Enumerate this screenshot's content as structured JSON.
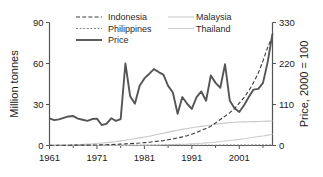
{
  "chart_data": {
    "type": "line",
    "title": "",
    "xlabel": "",
    "ylabel": "Million tonnes",
    "y2label": "Price, 2000 = 100",
    "xlim": [
      1961,
      2008
    ],
    "ylim": [
      0,
      90
    ],
    "y2lim": [
      0,
      330
    ],
    "grid": false,
    "legend_position": "top-inside",
    "xticks": [
      1961,
      1971,
      1981,
      1991,
      2001
    ],
    "xtick_labels": [
      "1961",
      "1971",
      "1981",
      "1991",
      "2001"
    ],
    "xminor_ticks": [
      1966,
      1976,
      1986,
      1996,
      2006
    ],
    "yticks": [
      0,
      30,
      60,
      90
    ],
    "ytick_labels": [
      "0",
      "30",
      "60",
      "90"
    ],
    "y2ticks": [
      0,
      110,
      220,
      330
    ],
    "y2tick_labels": [
      "0",
      "110",
      "220",
      "330"
    ],
    "x": [
      1961,
      1962,
      1963,
      1964,
      1965,
      1966,
      1967,
      1968,
      1969,
      1970,
      1971,
      1972,
      1973,
      1974,
      1975,
      1976,
      1977,
      1978,
      1979,
      1980,
      1981,
      1982,
      1983,
      1984,
      1985,
      1986,
      1987,
      1988,
      1989,
      1990,
      1991,
      1992,
      1993,
      1994,
      1995,
      1996,
      1997,
      1998,
      1999,
      2000,
      2001,
      2002,
      2003,
      2004,
      2005,
      2006,
      2007,
      2008
    ],
    "series": [
      {
        "name": "Indonesia",
        "axis": "left",
        "style": "dashed",
        "color": "#3a3a3a",
        "values": [
          0.2,
          0.2,
          0.2,
          0.2,
          0.2,
          0.3,
          0.3,
          0.3,
          0.3,
          0.4,
          0.4,
          0.5,
          0.6,
          0.7,
          0.8,
          1.0,
          1.2,
          1.4,
          1.6,
          1.8,
          2.1,
          2.4,
          2.8,
          3.2,
          3.6,
          4.2,
          4.8,
          5.5,
          6.3,
          7.2,
          8.3,
          9.6,
          11.0,
          12.5,
          14.0,
          16.5,
          19.0,
          21.5,
          24.0,
          27.0,
          31.0,
          35.0,
          40.0,
          46.0,
          53.0,
          62.0,
          72.0,
          80.0
        ]
      },
      {
        "name": "Philippines",
        "axis": "left",
        "style": "fine-dashed",
        "color": "#8a8a8a",
        "values": [
          0.1,
          0.1,
          0.1,
          0.1,
          0.1,
          0.1,
          0.1,
          0.1,
          0.1,
          0.1,
          0.1,
          0.1,
          0.1,
          0.2,
          0.2,
          0.2,
          0.2,
          0.2,
          0.2,
          0.2,
          0.2,
          0.2,
          0.3,
          0.3,
          0.3,
          0.3,
          0.3,
          0.3,
          0.3,
          0.3,
          0.3,
          0.3,
          0.3,
          0.3,
          0.3,
          0.3,
          0.4,
          0.4,
          0.4,
          0.4,
          0.4,
          0.4,
          0.4,
          0.5,
          0.5,
          0.5,
          0.5,
          0.5
        ]
      },
      {
        "name": "Malaysia",
        "axis": "left",
        "style": "light-solid",
        "color": "#c8c8c8",
        "values": [
          0.2,
          0.2,
          0.3,
          0.3,
          0.4,
          0.5,
          0.6,
          0.8,
          1.0,
          1.2,
          1.5,
          1.8,
          2.1,
          2.5,
          2.9,
          3.4,
          3.9,
          4.4,
          5.0,
          5.6,
          6.2,
          6.8,
          7.5,
          8.2,
          9.0,
          9.8,
          10.5,
          11.2,
          11.8,
          12.4,
          13.0,
          13.5,
          14.0,
          14.5,
          15.0,
          15.5,
          16.0,
          16.4,
          16.8,
          17.0,
          17.2,
          17.3,
          17.4,
          17.5,
          17.6,
          17.7,
          17.8,
          17.9
        ]
      },
      {
        "name": "Thailand",
        "axis": "left",
        "style": "light-solid",
        "color": "#cfcfcf",
        "values": [
          0.0,
          0.0,
          0.0,
          0.0,
          0.0,
          0.0,
          0.0,
          0.0,
          0.0,
          0.0,
          0.0,
          0.1,
          0.1,
          0.1,
          0.1,
          0.1,
          0.1,
          0.2,
          0.2,
          0.2,
          0.3,
          0.3,
          0.4,
          0.4,
          0.5,
          0.6,
          0.7,
          0.8,
          0.9,
          1.0,
          1.2,
          1.4,
          1.6,
          1.9,
          2.2,
          2.5,
          2.9,
          3.3,
          3.7,
          4.1,
          4.5,
          5.0,
          5.5,
          6.0,
          6.5,
          7.0,
          7.6,
          8.2
        ]
      },
      {
        "name": "Price",
        "axis": "right",
        "style": "thick-solid",
        "color": "#555555",
        "values": [
          73,
          68,
          70,
          74,
          78,
          79,
          72,
          69,
          66,
          71,
          72,
          55,
          58,
          73,
          66,
          71,
          220,
          132,
          112,
          160,
          180,
          192,
          205,
          197,
          190,
          160,
          142,
          85,
          130,
          112,
          98,
          130,
          145,
          120,
          188,
          168,
          155,
          218,
          120,
          100,
          90,
          108,
          130,
          150,
          152,
          168,
          225,
          300
        ]
      }
    ]
  }
}
